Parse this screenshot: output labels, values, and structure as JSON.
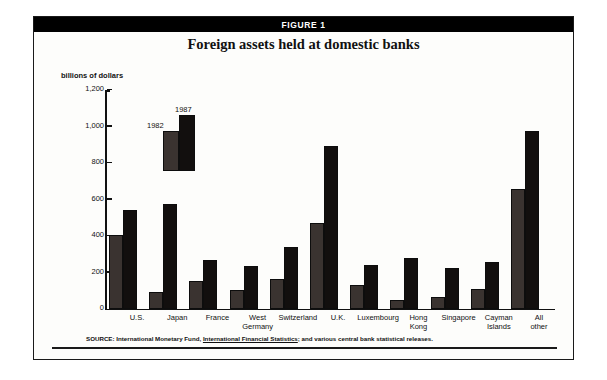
{
  "figure": {
    "banner_label": "FIGURE 1",
    "title": "Foreign assets held at domestic banks",
    "axis_unit_caption": "billions of dollars",
    "source_prefix": "SOURCE: International Monetary Fund, ",
    "source_italic": "International Financial Statistics",
    "source_suffix": "; and various central bank statistical releases."
  },
  "legend": {
    "series_1_label": "1982",
    "series_2_label": "1987",
    "series_1_color": "#3a3330",
    "series_2_color": "#120f0e"
  },
  "chart_data": {
    "type": "bar",
    "title": "Foreign assets held at domestic banks",
    "xlabel": "",
    "ylabel": "billions of dollars",
    "ylim": [
      0,
      1200
    ],
    "yticks": [
      "0",
      "200",
      "400",
      "600",
      "800",
      "1,000",
      "1,200"
    ],
    "ytick_values": [
      0,
      200,
      400,
      600,
      800,
      1000,
      1200
    ],
    "grid": false,
    "legend_position": "inside-upper-left",
    "categories": [
      "U.S.",
      "Japan",
      "France",
      "West Germany",
      "Switzerland",
      "U.K.",
      "Luxembourg",
      "Hong Kong",
      "Singapore",
      "Cayman Islands",
      "All other"
    ],
    "category_lines": [
      [
        "U.S."
      ],
      [
        "Japan"
      ],
      [
        "France"
      ],
      [
        "West",
        "Germany"
      ],
      [
        "Switzerland"
      ],
      [
        "U.K."
      ],
      [
        "Luxembourg"
      ],
      [
        "Hong",
        "Kong"
      ],
      [
        "Singapore"
      ],
      [
        "Cayman",
        "Islands"
      ],
      [
        "All",
        "other"
      ]
    ],
    "series": [
      {
        "name": "1982",
        "color": "#3a3330",
        "values": [
          405,
          95,
          155,
          105,
          165,
          470,
          130,
          50,
          65,
          110,
          655
        ]
      },
      {
        "name": "1987",
        "color": "#120f0e",
        "values": [
          545,
          575,
          270,
          235,
          340,
          895,
          240,
          280,
          225,
          260,
          975
        ]
      }
    ]
  }
}
